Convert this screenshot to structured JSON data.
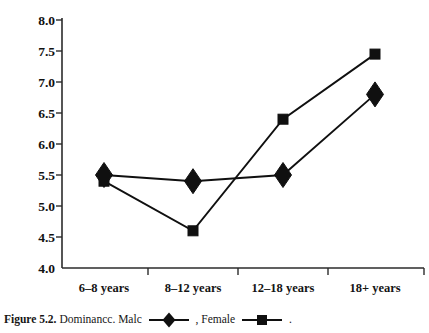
{
  "caption": {
    "figure_label": "Figure 5.2.",
    "title_text": "Dominancc.",
    "male_label": "Malc",
    "separator": ",",
    "female_label": "Female",
    "trailing": "."
  },
  "chart_data": {
    "type": "line",
    "title": "",
    "xlabel": "",
    "ylabel": "",
    "categories": [
      "6–8 years",
      "8–12 years",
      "12–18 years",
      "18+ years"
    ],
    "series": [
      {
        "name": "Malc",
        "marker": "diamond",
        "values": [
          5.5,
          5.4,
          5.5,
          6.8
        ]
      },
      {
        "name": "Female",
        "marker": "square",
        "values": [
          5.4,
          4.6,
          6.4,
          7.45
        ]
      }
    ],
    "ylim": [
      4.0,
      8.0
    ],
    "ytick_labels": [
      "8.0",
      "7.5",
      "7.0",
      "6.5",
      "6.0",
      "5.5",
      "5.0",
      "4.5",
      "4.0"
    ],
    "ytick_values": [
      8.0,
      7.5,
      7.0,
      6.5,
      6.0,
      5.5,
      5.0,
      4.5,
      4.0
    ],
    "grid": false,
    "legend_position": "caption",
    "line_color": "#101010",
    "axis_color": "#2b2b2b"
  }
}
